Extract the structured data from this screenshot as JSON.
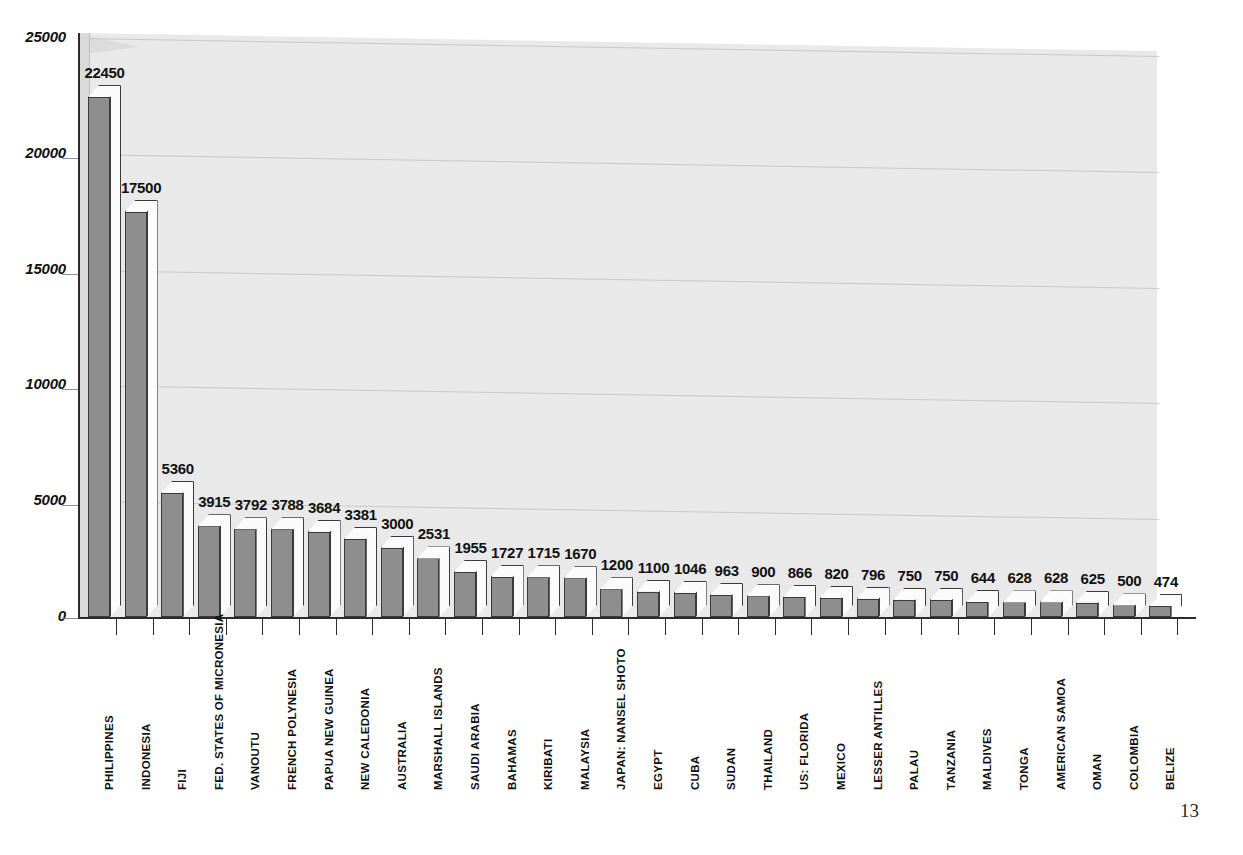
{
  "page": {
    "number": "13"
  },
  "chart_data": {
    "type": "bar",
    "title": "",
    "subtitle": "",
    "xlabel": "",
    "ylabel": "",
    "ylim": [
      0,
      25000
    ],
    "ytick_values": [
      0,
      5000,
      10000,
      15000,
      20000,
      25000
    ],
    "ytick_labels": [
      "0",
      "5000",
      "10000",
      "15000",
      "20000",
      "25000"
    ],
    "grid": true,
    "grid_axis": "y",
    "legend": false,
    "legend_position": "none",
    "style": "3d-column",
    "bar_face_color": "#8e8e8e",
    "bar_side_color": "#fbfbfb",
    "plot_background_color": "#e9e9e9",
    "axis_color": "#2b2b2b",
    "categories": [
      "PHILIPPINES",
      "INDONESIA",
      "FIJI",
      "FED. STATES OF  MICRONESIA",
      "VANOUTU",
      "FRENCH POLYNESIA",
      "PAPUA NEW GUINEA",
      "NEW CALEDONIA",
      "AUSTRALIA",
      "MARSHALL ISLANDS",
      "SAUDI ARABIA",
      "BAHAMAS",
      "KIRIBATI",
      "MALAYSIA",
      "JAPAN: NANSEL SHOTO",
      "EGYPT",
      "CUBA",
      "SUDAN",
      "THAILAND",
      "US: FLORIDA",
      "MEXICO",
      "LESSER ANTILLES",
      "PALAU",
      "TANZANIA",
      "MALDIVES",
      "TONGA",
      "AMERICAN SAMOA",
      "OMAN",
      "COLOMBIA",
      "BELIZE"
    ],
    "values": [
      22450,
      17500,
      5360,
      3915,
      3792,
      3788,
      3684,
      3381,
      3000,
      2531,
      1955,
      1727,
      1715,
      1670,
      1200,
      1100,
      1046,
      963,
      900,
      866,
      820,
      796,
      750,
      750,
      644,
      628,
      628,
      625,
      500,
      474
    ],
    "value_labels": [
      "22450",
      "17500",
      "5360",
      "3915",
      "3792",
      "3788",
      "3684",
      "3381",
      "3000",
      "2531",
      "1955",
      "1727",
      "1715",
      "1670",
      "1200",
      "1100",
      "1046",
      "963",
      "900",
      "866",
      "820",
      "796",
      "750",
      "750",
      "644",
      "628",
      "628",
      "625",
      "500",
      "474"
    ]
  }
}
